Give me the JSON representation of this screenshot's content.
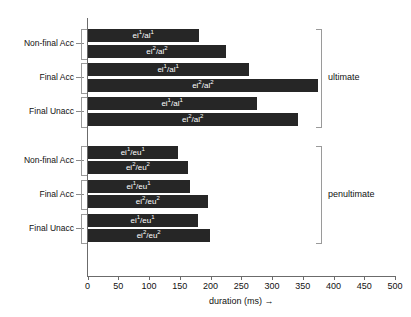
{
  "chart_data": {
    "type": "bar",
    "orientation": "horizontal",
    "title": "",
    "xlabel": "duration (ms) →",
    "ylabel": "",
    "xlim": [
      0,
      500
    ],
    "xticks": [
      0,
      50,
      100,
      150,
      200,
      250,
      300,
      350,
      400,
      450,
      500
    ],
    "grid": false,
    "legend": "none",
    "bar_color": "#262626",
    "axis_color": "#6b6b6b",
    "groups": [
      {
        "name": "ultimate",
        "categories": [
          "Non-final Acc",
          "Final Acc",
          "Final Unacc"
        ],
        "bars": [
          {
            "category": "Non-final Acc",
            "label_base": "ei",
            "label_sup1": "1",
            "label_mid": "/al",
            "label_sup2": "1",
            "value": 181
          },
          {
            "category": "Non-final Acc",
            "label_base": "ei",
            "label_sup1": "2",
            "label_mid": "/al",
            "label_sup2": "2",
            "value": 226
          },
          {
            "category": "Final Acc",
            "label_base": "ei",
            "label_sup1": "1",
            "label_mid": "/al",
            "label_sup2": "1",
            "value": 262
          },
          {
            "category": "Final Acc",
            "label_base": "ei",
            "label_sup1": "2",
            "label_mid": "/al",
            "label_sup2": "2",
            "value": 375
          },
          {
            "category": "Final Unacc",
            "label_base": "ei",
            "label_sup1": "1",
            "label_mid": "/al",
            "label_sup2": "1",
            "value": 275
          },
          {
            "category": "Final Unacc",
            "label_base": "ei",
            "label_sup1": "2",
            "label_mid": "/al",
            "label_sup2": "2",
            "value": 342
          }
        ]
      },
      {
        "name": "penultimate",
        "categories": [
          "Non-final Acc",
          "Final Acc",
          "Final Unacc"
        ],
        "bars": [
          {
            "category": "Non-final Acc",
            "label_base": "ei",
            "label_sup1": "1",
            "label_mid": "/eu",
            "label_sup2": "1",
            "value": 147
          },
          {
            "category": "Non-final Acc",
            "label_base": "ei",
            "label_sup1": "2",
            "label_mid": "/eu",
            "label_sup2": "2",
            "value": 164
          },
          {
            "category": "Final Acc",
            "label_base": "ei",
            "label_sup1": "1",
            "label_mid": "/eu",
            "label_sup2": "1",
            "value": 166
          },
          {
            "category": "Final Acc",
            "label_base": "ei",
            "label_sup1": "2",
            "label_mid": "/eu",
            "label_sup2": "2",
            "value": 196
          },
          {
            "category": "Final Unacc",
            "label_base": "ei",
            "label_sup1": "1",
            "label_mid": "/eu",
            "label_sup2": "1",
            "value": 179
          },
          {
            "category": "Final Unacc",
            "label_base": "ei",
            "label_sup1": "2",
            "label_mid": "/eu",
            "label_sup2": "2",
            "value": 199
          }
        ]
      }
    ]
  },
  "axis": {
    "x_title": "duration (ms) →",
    "tick_labels": [
      "0",
      "50",
      "100",
      "150",
      "200",
      "250",
      "300",
      "350",
      "400",
      "450",
      "500"
    ]
  },
  "categories": {
    "ultimate": [
      "Non-final Acc",
      "Final Acc",
      "Final Unacc"
    ],
    "penultimate": [
      "Non-final Acc",
      "Final Acc",
      "Final Unacc"
    ]
  },
  "group_labels": {
    "ultimate": "ultimate",
    "penultimate": "penultimate"
  }
}
